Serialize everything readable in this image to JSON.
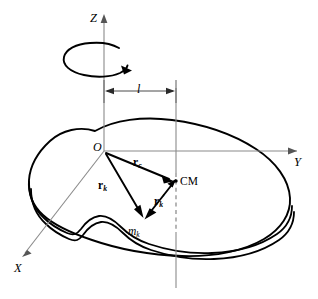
{
  "figure": {
    "kind": "physics-diagram",
    "background_color": "#ffffff",
    "ink_color": "#000000",
    "axis_color": "#8a8a8a"
  },
  "axes": {
    "z": {
      "label": "Z",
      "direction": "up"
    },
    "y": {
      "label": "Y",
      "direction": "right"
    },
    "x": {
      "label": "X",
      "direction": "down-left"
    }
  },
  "origin": {
    "label": "O"
  },
  "rotation": {
    "name": "spin-indicator",
    "sense": "counterclockwise-about-z"
  },
  "dimension": {
    "label": "l",
    "description": "distance from the Z axis to the vertical line through the centre of mass"
  },
  "points": [
    {
      "name": "origin",
      "label": "O"
    },
    {
      "name": "centre-of-mass",
      "label": "CM"
    },
    {
      "name": "mass-element",
      "label": "m",
      "subscript": "k"
    }
  ],
  "vectors": [
    {
      "name": "r-c",
      "label": "r",
      "subscript": "c",
      "prime": false,
      "from": "O",
      "to": "CM",
      "description": "position vector of the centre of mass from the origin"
    },
    {
      "name": "r-k",
      "label": "r",
      "subscript": "k",
      "prime": false,
      "from": "O",
      "to": "m_k",
      "description": "position vector of the k-th mass element from the origin"
    },
    {
      "name": "r-k-prime",
      "label": "r",
      "subscript": "k",
      "prime": true,
      "from": "m_k",
      "to": "CM",
      "description": "position vector of the k-th mass element relative to the centre of mass"
    }
  ],
  "labels": {
    "z_axis": "Z",
    "y_axis": "Y",
    "x_axis": "X",
    "origin": "O",
    "cm": "CM",
    "length": "l",
    "mass_symbol": "m",
    "mass_subscript": "k",
    "vector_symbol": "r",
    "vector_c_subscript": "c",
    "vector_k_subscript": "k"
  },
  "body": {
    "name": "rigid-body",
    "description": "irregular flat slab drawn in perspective with visible thickness along its lower edge"
  }
}
